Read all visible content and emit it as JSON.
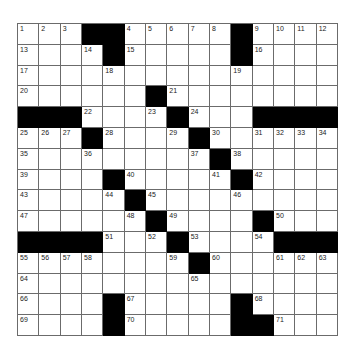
{
  "puzzle": {
    "size": [
      15,
      15
    ],
    "colors": {
      "block": "#000000",
      "cell": "#ffffff",
      "grid_line": "#6b6b6b"
    },
    "rows": [
      [
        "1",
        "2",
        "3",
        "#",
        "#",
        "4",
        "5",
        "6",
        "7",
        "8",
        "#",
        "9",
        "10",
        "11",
        "12"
      ],
      [
        "13",
        "",
        "",
        "14",
        "#",
        "15",
        "",
        "",
        "",
        "",
        "#",
        "16",
        "",
        "",
        ""
      ],
      [
        "17",
        "",
        "",
        "",
        "18",
        "",
        "",
        "",
        "",
        "",
        "19",
        "",
        "",
        "",
        ""
      ],
      [
        "20",
        "",
        "",
        "",
        "",
        "",
        "#",
        "21",
        "",
        "",
        "",
        "",
        "",
        "",
        ""
      ],
      [
        "#",
        "#",
        "#",
        "22",
        "",
        "",
        "23",
        "#",
        "24",
        "",
        "",
        "#",
        "#",
        "#",
        "#"
      ],
      [
        "25",
        "26",
        "27",
        "#",
        "28",
        "",
        "",
        "29",
        "#",
        "30",
        "",
        "31",
        "32",
        "33",
        "34"
      ],
      [
        "35",
        "",
        "",
        "36",
        "",
        "",
        "",
        "",
        "37",
        "#",
        "38",
        "",
        "",
        "",
        ""
      ],
      [
        "39",
        "",
        "",
        "",
        "#",
        "40",
        "",
        "",
        "",
        "41",
        "#",
        "42",
        "",
        "",
        ""
      ],
      [
        "43",
        "",
        "",
        "",
        "44",
        "#",
        "45",
        "",
        "",
        "",
        "46",
        "",
        "",
        "",
        ""
      ],
      [
        "47",
        "",
        "",
        "",
        "",
        "48",
        "#",
        "49",
        "",
        "",
        "",
        "#",
        "50",
        "",
        ""
      ],
      [
        "#",
        "#",
        "#",
        "#",
        "51",
        "",
        "52",
        "#",
        "53",
        "",
        "",
        "54",
        "#",
        "#",
        "#"
      ],
      [
        "55",
        "56",
        "57",
        "58",
        "",
        "",
        "",
        "59",
        "#",
        "60",
        "",
        "",
        "61",
        "62",
        "63"
      ],
      [
        "64",
        "",
        "",
        "",
        "",
        "",
        "",
        "",
        "65",
        "",
        "",
        "",
        "",
        "",
        ""
      ],
      [
        "66",
        "",
        "",
        "",
        "#",
        "67",
        "",
        "",
        "",
        "",
        "#",
        "68",
        "",
        "",
        ""
      ],
      [
        "69",
        "",
        "",
        "",
        "#",
        "70",
        "",
        "",
        "",
        "",
        "#",
        "#",
        "71",
        "",
        ""
      ]
    ]
  }
}
